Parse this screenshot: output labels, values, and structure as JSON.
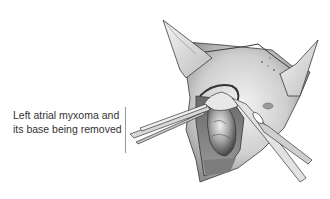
{
  "figure": {
    "caption_lines": [
      "Left atrial myxoma and",
      "its base being removed"
    ],
    "illustration": {
      "subject": "surgical view of left atrium opened with retractors; forceps and scissors excising myxoma",
      "palette": {
        "background": "#ffffff",
        "tissue_light": "#e4e4e4",
        "tissue_mid": "#b8b8b8",
        "tissue_dark": "#555555",
        "line": "#3a3a3a"
      }
    }
  }
}
